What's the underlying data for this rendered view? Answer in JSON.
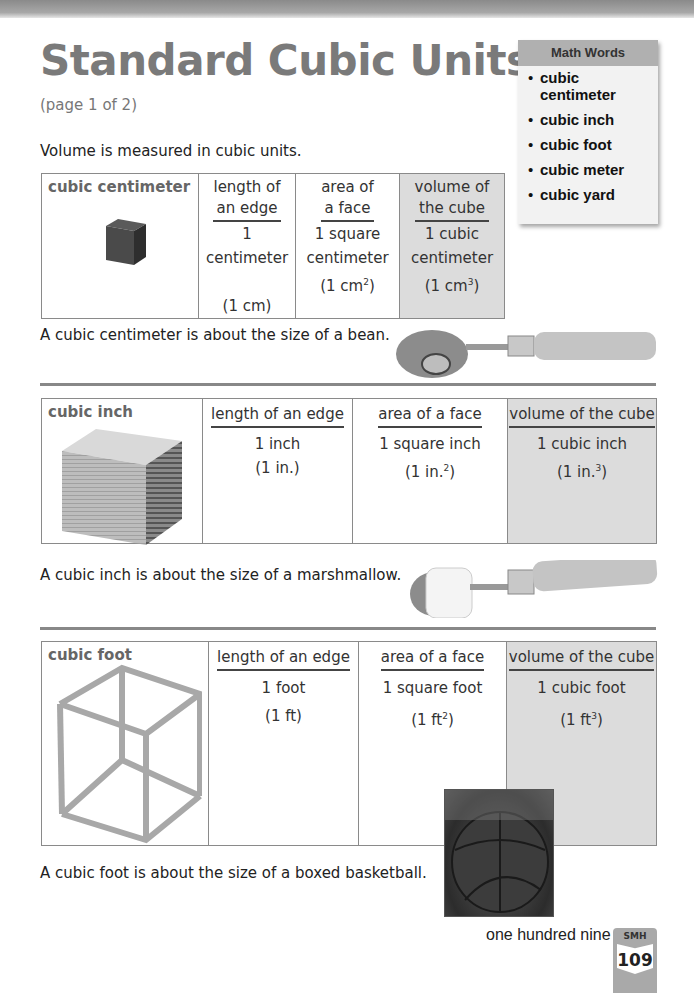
{
  "header": {
    "title": "Standard Cubic Units",
    "subtitle": "(page 1 of 2)"
  },
  "math_words": {
    "heading": "Math Words",
    "items": [
      "cubic centimeter",
      "cubic inch",
      "cubic foot",
      "cubic meter",
      "cubic yard"
    ]
  },
  "intro": "Volume is measured in cubic units.",
  "tables": [
    {
      "unit": "cubic centimeter",
      "image": "small-dark-cube",
      "columns": [
        {
          "header_line1": "length of",
          "header_line2": "an edge",
          "value_line1": "1 centimeter",
          "value_line2": "",
          "abbr": "(1 cm)",
          "exponent": ""
        },
        {
          "header_line1": "area of",
          "header_line2": "a face",
          "value_line1": "1 square",
          "value_line2": "centimeter",
          "abbr": "(1 cm",
          "exponent": "2"
        },
        {
          "header_line1": "volume of",
          "header_line2": "the cube",
          "value_line1": "1 cubic",
          "value_line2": "centimeter",
          "abbr": "(1 cm",
          "exponent": "3"
        }
      ],
      "caption": "A cubic centimeter is about the size of a bean.",
      "caption_image": "spoon-with-bean"
    },
    {
      "unit": "cubic inch",
      "image": "wooden-cube",
      "columns": [
        {
          "header": "length of an edge",
          "value": "1 inch",
          "abbr": "(1 in.)",
          "exponent": ""
        },
        {
          "header": "area of a face",
          "value": "1 square inch",
          "abbr": "(1 in.",
          "exponent": "2"
        },
        {
          "header": "volume of the cube",
          "value": "1 cubic inch",
          "abbr": "(1 in.",
          "exponent": "3"
        }
      ],
      "caption": "A cubic inch is about the size of a marshmallow.",
      "caption_image": "spoon-with-marshmallow"
    },
    {
      "unit": "cubic foot",
      "image": "wire-frame-cube",
      "columns": [
        {
          "header": "length of an edge",
          "value": "1 foot",
          "abbr": "(1 ft)",
          "exponent": ""
        },
        {
          "header": "area of a face",
          "value": "1 square foot",
          "abbr": "(1 ft",
          "exponent": "2"
        },
        {
          "header": "volume of the cube",
          "value": "1 cubic foot",
          "abbr": "(1 ft",
          "exponent": "3"
        }
      ],
      "caption": "A cubic foot is about the size of a boxed basketball.",
      "caption_image": "boxed-basketball"
    }
  ],
  "footer": {
    "page_words": "one hundred nine",
    "badge_label": "SMH",
    "page_number": "109"
  }
}
